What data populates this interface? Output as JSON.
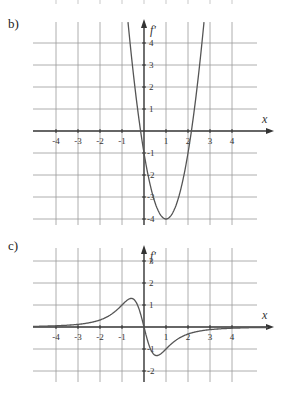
{
  "panels": [
    {
      "id": "b",
      "label": "b)",
      "ylabel": "f'",
      "xlabel": "x"
    },
    {
      "id": "c",
      "label": "c)",
      "ylabel": "f'",
      "xlabel": "x"
    }
  ],
  "colors": {
    "grid": "#9a9a9a",
    "axis": "#333333",
    "curve": "#555555"
  },
  "chart_data": [
    {
      "type": "line",
      "title": "b)",
      "xlabel": "x",
      "ylabel": "f'",
      "x_ticks": [
        -4,
        -3,
        -2,
        -1,
        1,
        2,
        3,
        4
      ],
      "y_ticks": [
        4,
        3,
        2,
        1,
        -1,
        -2,
        -3,
        -4
      ],
      "xlim": [
        -5,
        5
      ],
      "ylim": [
        -4.4,
        5
      ],
      "grid": true,
      "series": [
        {
          "name": "f'(x)",
          "formula": "3(x-1)^2-4",
          "x": [
            -0.7,
            -0.5,
            -0.155,
            0,
            0.5,
            1,
            1.5,
            2,
            2.155,
            2.5,
            2.7
          ],
          "y": [
            4.67,
            2.75,
            0,
            -1,
            -3.25,
            -4,
            -3.25,
            -1,
            0,
            2.75,
            4.67
          ]
        }
      ]
    },
    {
      "type": "line",
      "title": "c)",
      "xlabel": "x",
      "ylabel": "f'",
      "x_ticks": [
        -4,
        -3,
        -2,
        -1,
        1,
        2,
        3,
        4
      ],
      "y_ticks": [
        3,
        2,
        1,
        -1,
        -2
      ],
      "xlim": [
        -5,
        5
      ],
      "ylim": [
        -2.4,
        4
      ],
      "grid": true,
      "series": [
        {
          "name": "f'(x)",
          "formula": "-4x/(1+x^2)^2",
          "x": [
            -4,
            -3,
            -2,
            -1,
            -0.58,
            0,
            0.58,
            1,
            2,
            3,
            4
          ],
          "y": [
            0.06,
            0.12,
            0.32,
            1.0,
            1.3,
            0,
            -1.3,
            -1.0,
            -0.32,
            -0.12,
            -0.06
          ]
        }
      ]
    }
  ]
}
